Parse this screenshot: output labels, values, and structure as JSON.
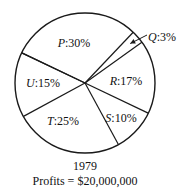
{
  "chart_data": {
    "type": "pie",
    "title": "1979",
    "subtitle": "Profits = $20,000,000",
    "slices": [
      {
        "label": "P",
        "value": 30
      },
      {
        "label": "Q",
        "value": 3
      },
      {
        "label": "R",
        "value": 17
      },
      {
        "label": "S",
        "value": 10
      },
      {
        "label": "T",
        "value": 25
      },
      {
        "label": "U",
        "value": 15
      }
    ],
    "value_unit": "%",
    "start_angle_deg": 205.5,
    "direction": "clockwise",
    "callout": {
      "slice": "Q",
      "style": "arrow-outside"
    },
    "colors": {
      "line": "#1a1a1a",
      "fill": "#ffffff",
      "text": "#111111"
    }
  }
}
